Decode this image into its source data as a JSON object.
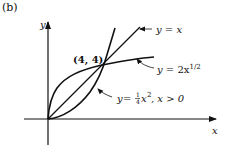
{
  "figure": {
    "panel_label": "(b)",
    "axes": {
      "x_label": "x",
      "y_label": "y"
    },
    "intersection_label": "(4, 4)",
    "curves": [
      {
        "name": "line",
        "label_lhs": "y",
        "label_eq": " = ",
        "label_rhs": "x"
      },
      {
        "name": "sqrt",
        "label_lhs": "y",
        "label_eq": " = ",
        "label_rhs": "2x",
        "label_sup": "1/2"
      },
      {
        "name": "parabola",
        "label_lhs": "y",
        "label_eq": " = ",
        "frac_num": "1",
        "frac_den": "4",
        "label_rhs": "x",
        "label_sup": "2",
        "label_cond": ", x > 0"
      }
    ]
  }
}
